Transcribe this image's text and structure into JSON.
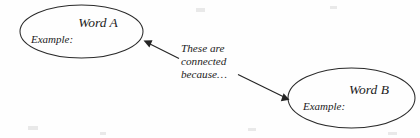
{
  "diagram": {
    "type": "concept-map",
    "background_color": "#fefefe",
    "stroke_color": "#2a2a2a",
    "text_color": "#1c1c1c",
    "nodes": [
      {
        "id": "word-a",
        "title": "Word A",
        "subtitle": "Example:",
        "shape": "ellipse"
      },
      {
        "id": "word-b",
        "title": "Word B",
        "subtitle": "Example:",
        "shape": "ellipse"
      }
    ],
    "annotation": {
      "lines": [
        "These are",
        "connected",
        "because…"
      ]
    },
    "connectors": [
      {
        "id": "arrow-to-word-a",
        "direction": "up-left",
        "target": "word-a"
      },
      {
        "id": "arrow-to-word-b",
        "direction": "down-right",
        "target": "word-b"
      }
    ]
  }
}
